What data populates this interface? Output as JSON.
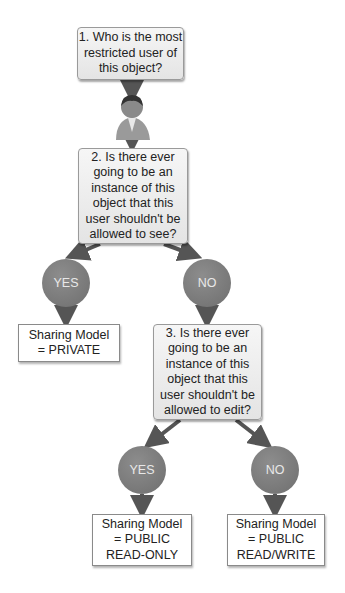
{
  "questions": [
    {
      "id": "q1",
      "text": "1. Who is the most restricted user of this object?"
    },
    {
      "id": "q2",
      "text": "2. Is there ever going to be an instance of this object that this user shouldn't be allowed to see?"
    },
    {
      "id": "q3",
      "text": "3. Is there ever going to be an instance of this object that this user shouldn't be allowed to edit?"
    }
  ],
  "answers": {
    "q2_yes": "YES",
    "q2_no": "NO",
    "q3_yes": "YES",
    "q3_no": "NO"
  },
  "results": {
    "private": "Sharing Model = PRIVATE",
    "public_read_only": "Sharing Model = PUBLIC READ-ONLY",
    "public_read_write": "Sharing Model = PUBLIC READ/WRITE"
  },
  "colors": {
    "connector": "#555555",
    "circle": "#7a7a7a",
    "question_fill": "#ececec",
    "result_fill": "#ffffff"
  },
  "icons": {
    "user": "user-icon"
  }
}
